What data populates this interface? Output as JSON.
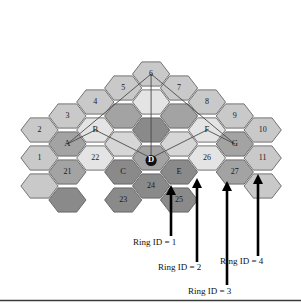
{
  "figure": {
    "type": "hex-cell-cluster-diagram",
    "width": 301,
    "height": 303,
    "background": "#ffffff"
  },
  "palette": {
    "light": "#c9c9c9",
    "lighter": "#d6d6d6",
    "pale": "#e4e4e4",
    "mid": "#a3a3a3",
    "dark": "#8a8a8a",
    "darker": "#7a7a7a",
    "outline": "#555555",
    "text": "#1a1a1a",
    "arrow": "#000000"
  },
  "hexagons": [
    {
      "id": "h2",
      "label": "2",
      "col": 0,
      "row": 0,
      "tone": "light"
    },
    {
      "id": "h1",
      "label": "1",
      "col": 0,
      "row": 1,
      "tone": "light"
    },
    {
      "id": "hL3",
      "label": "",
      "col": 0,
      "row": 2,
      "tone": "light"
    },
    {
      "id": "h3",
      "label": "3",
      "col": 1,
      "row": -1,
      "tone": "light"
    },
    {
      "id": "hA",
      "label": "A",
      "col": 1,
      "row": 0,
      "tone": "mid"
    },
    {
      "id": "h21",
      "label": "21",
      "col": 1,
      "row": 1,
      "tone": "mid"
    },
    {
      "id": "hL4",
      "label": "",
      "col": 1,
      "row": 2,
      "tone": "dark"
    },
    {
      "id": "h4",
      "label": "4",
      "col": 2,
      "row": -1,
      "tone": "light"
    },
    {
      "id": "hB",
      "label": "B",
      "col": 2,
      "row": 0,
      "tone": "pale"
    },
    {
      "id": "h22",
      "label": "22",
      "col": 2,
      "row": 1,
      "tone": "pale"
    },
    {
      "id": "h5",
      "label": "5",
      "col": 3,
      "row": -2,
      "tone": "light"
    },
    {
      "id": "hM1",
      "label": "",
      "col": 3,
      "row": -1,
      "tone": "mid"
    },
    {
      "id": "hM2",
      "label": "",
      "col": 3,
      "row": 0,
      "tone": "lighter"
    },
    {
      "id": "hC",
      "label": "C",
      "col": 3,
      "row": 1,
      "tone": "dark"
    },
    {
      "id": "h23",
      "label": "23",
      "col": 3,
      "row": 2,
      "tone": "dark"
    },
    {
      "id": "h6",
      "label": "6",
      "col": 4,
      "row": -2,
      "tone": "light"
    },
    {
      "id": "hM3",
      "label": "",
      "col": 4,
      "row": -1,
      "tone": "pale"
    },
    {
      "id": "hM4",
      "label": "",
      "col": 4,
      "row": 0,
      "tone": "dark"
    },
    {
      "id": "hD",
      "label": "D",
      "col": 4,
      "row": 1,
      "tone": "mid"
    },
    {
      "id": "h24",
      "label": "24",
      "col": 4,
      "row": 2,
      "tone": "dark"
    },
    {
      "id": "h7",
      "label": "7",
      "col": 5,
      "row": -2,
      "tone": "light"
    },
    {
      "id": "hM5",
      "label": "",
      "col": 5,
      "row": -1,
      "tone": "mid"
    },
    {
      "id": "hM6",
      "label": "",
      "col": 5,
      "row": 0,
      "tone": "lighter"
    },
    {
      "id": "hE",
      "label": "E",
      "col": 5,
      "row": 1,
      "tone": "dark"
    },
    {
      "id": "h25",
      "label": "25",
      "col": 5,
      "row": 2,
      "tone": "dark"
    },
    {
      "id": "h8",
      "label": "8",
      "col": 6,
      "row": -1,
      "tone": "light"
    },
    {
      "id": "hF",
      "label": "F",
      "col": 6,
      "row": 0,
      "tone": "pale"
    },
    {
      "id": "h26",
      "label": "26",
      "col": 6,
      "row": 1,
      "tone": "pale"
    },
    {
      "id": "h9",
      "label": "9",
      "col": 7,
      "row": -1,
      "tone": "light"
    },
    {
      "id": "hG",
      "label": "G",
      "col": 7,
      "row": 0,
      "tone": "mid"
    },
    {
      "id": "h27",
      "label": "27",
      "col": 7,
      "row": 1,
      "tone": "mid"
    },
    {
      "id": "h10",
      "label": "10",
      "col": 8,
      "row": 0,
      "tone": "light"
    },
    {
      "id": "h11",
      "label": "11",
      "col": 8,
      "row": 1,
      "tone": "light"
    },
    {
      "id": "hR3",
      "label": "",
      "col": 8,
      "row": 2,
      "tone": "light"
    }
  ],
  "guide_lines": {
    "description": "sector boundary lines joining cluster centers",
    "segments": [
      {
        "name": "A-to-apex",
        "from": "A",
        "to": "apex"
      },
      {
        "name": "apex-to-G",
        "from": "apex",
        "to": "G"
      },
      {
        "name": "apex-to-D",
        "from": "apex",
        "to": "D"
      },
      {
        "name": "A-to-B-to-D",
        "from": "A",
        "to": "D"
      },
      {
        "name": "G-to-F-to-D",
        "from": "G",
        "to": "D"
      }
    ]
  },
  "annotations": {
    "arrows": [
      {
        "id": "arrow1",
        "label": "Ring ID = 1",
        "tip_x": 171,
        "tip_y": 185,
        "tail_y": 236,
        "label_x": 133,
        "label_y": 243
      },
      {
        "id": "arrow2",
        "label": "Ring ID = 2",
        "tip_x": 197,
        "tip_y": 178,
        "tail_y": 262,
        "label_x": 158,
        "label_y": 268
      },
      {
        "id": "arrow3",
        "label": "Ring ID = 3",
        "tip_x": 227,
        "tip_y": 181,
        "tail_y": 285,
        "label_x": 188,
        "label_y": 292
      },
      {
        "id": "arrow4",
        "label": "Ring ID = 4",
        "tip_x": 258,
        "tip_y": 174,
        "tail_y": 256,
        "label_x": 220,
        "label_y": 262
      }
    ]
  },
  "cell_labels_summary": {
    "numeric": [
      "1",
      "2",
      "3",
      "4",
      "5",
      "6",
      "7",
      "8",
      "9",
      "10",
      "11",
      "21",
      "22",
      "23",
      "24",
      "25",
      "26",
      "27"
    ],
    "alphabetic": [
      "A",
      "B",
      "C",
      "D",
      "E",
      "F",
      "G"
    ]
  }
}
